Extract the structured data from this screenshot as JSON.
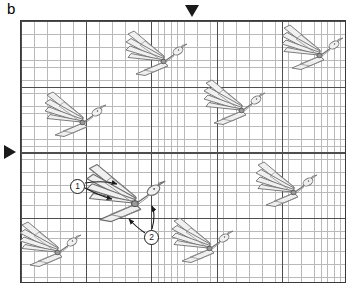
{
  "figure": {
    "panel_label": "b",
    "caption_absent": true,
    "background_color": "#ffffff",
    "width": 361,
    "height": 290
  },
  "plot": {
    "border_color": "#3a3a3a",
    "grid": {
      "minor_color": "#b9b9b9",
      "major_color": "#4e4e4e",
      "minor_cell_px": 6.5,
      "major_every_n_minor": 10,
      "minor_cols": 50,
      "minor_rows": 40,
      "major_cols": 5,
      "major_rows": 4
    },
    "bounds": {
      "left": 20,
      "top": 20,
      "width": 326,
      "height": 263
    }
  },
  "markers": [
    {
      "name": "top-reference-marker",
      "shape": "triangle-down",
      "color": "#1a1a1a",
      "x": 192,
      "y": 11
    },
    {
      "name": "left-reference-marker",
      "shape": "triangle-right",
      "color": "#1a1a1a",
      "x": 10,
      "y": 152
    }
  ],
  "callouts": [
    {
      "label": "1",
      "x": 77,
      "y": 185,
      "points_to": "wing-primary-feathers"
    },
    {
      "label": "2",
      "x": 151,
      "y": 236,
      "points_to": "head-and-beak"
    }
  ],
  "birds": [
    {
      "id": "bird-1",
      "x": 81,
      "y": 122,
      "scale": 1.0,
      "rotation": 0
    },
    {
      "id": "bird-2",
      "x": 162,
      "y": 61,
      "scale": 1.0,
      "rotation": 0
    },
    {
      "id": "bird-3",
      "x": 240,
      "y": 110,
      "scale": 1.0,
      "rotation": 0
    },
    {
      "id": "bird-4",
      "x": 318,
      "y": 55,
      "scale": 1.0,
      "rotation": 0
    },
    {
      "id": "bird-5",
      "x": 56,
      "y": 252,
      "scale": 1.0,
      "rotation": 0
    },
    {
      "id": "bird-6",
      "x": 130,
      "y": 200,
      "scale": 1.28,
      "rotation": 0
    },
    {
      "id": "bird-7",
      "x": 208,
      "y": 248,
      "scale": 1.0,
      "rotation": 0
    },
    {
      "id": "bird-8",
      "x": 292,
      "y": 192,
      "scale": 1.0,
      "rotation": 0
    }
  ],
  "bird_style": {
    "stroke_color": "#6e6e6e",
    "stroke_color_dark": "#4a4a4a",
    "fill_color": "#f2f2f2",
    "description": "stylized flying bird, swept-back primary feathers, slender body, pointed head and beak"
  },
  "annotation_lines": {
    "stroke_color": "#1a1a1a",
    "arrow_count": 4
  }
}
